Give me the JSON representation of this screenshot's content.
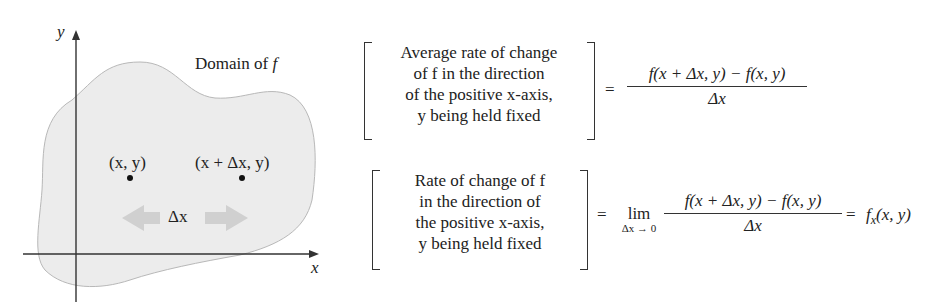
{
  "figure": {
    "axis_x_label": "x",
    "axis_y_label": "y",
    "region_label": "Domain of ",
    "region_label_fn": "f",
    "point1_label": "(x, y)",
    "point2_label": "(x + Δx, y)",
    "delta_label": "Δx",
    "colors": {
      "region_fill": "#ececec",
      "region_stroke": "#b8b8b8",
      "arrow_fill": "#cfcfcf",
      "axis": "#333333"
    }
  },
  "equation1": {
    "lines": [
      "Average rate of change",
      "of f in the direction",
      "of the positive x-axis,",
      "y being held fixed"
    ],
    "equals": "=",
    "numerator": "f(x + Δx, y) − f(x, y)",
    "denominator": "Δx"
  },
  "equation2": {
    "lines": [
      "Rate of change of f",
      "in the direction of",
      "the positive x-axis,",
      "y being held fixed"
    ],
    "equals": "=",
    "lim_word": "lim",
    "lim_sub": "Δx → 0",
    "numerator": "f(x + Δx, y) − f(x, y)",
    "denominator": "Δx",
    "equals2": "=",
    "result_fn": "f",
    "result_sub": "x",
    "result_args": "(x, y)"
  }
}
